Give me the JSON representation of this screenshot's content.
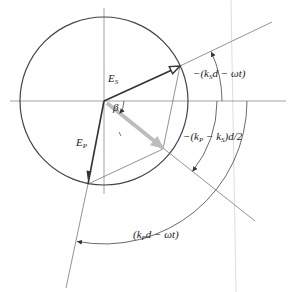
{
  "diagram": {
    "colors": {
      "vector": "#333333",
      "circle": "#444444",
      "axis": "#8a8a8a",
      "guide": "#cfcfcf",
      "resultant": "#bdbdbd",
      "background": "#ffffff"
    },
    "labels": {
      "E_s": {
        "main": "E",
        "sub": "S"
      },
      "E_p": {
        "main": "E",
        "sub": "P"
      },
      "beta": "β",
      "angle_s": {
        "pre": "−(k",
        "sub": "S",
        "post": "d − ωt)"
      },
      "angle_diff": {
        "pre": "−(k",
        "sub1": "P",
        "mid": " − k",
        "sub2": "S",
        "post": ")d/2"
      },
      "angle_p": {
        "pre": "(k",
        "sub": "P",
        "post": "d − ωt)"
      }
    }
  }
}
